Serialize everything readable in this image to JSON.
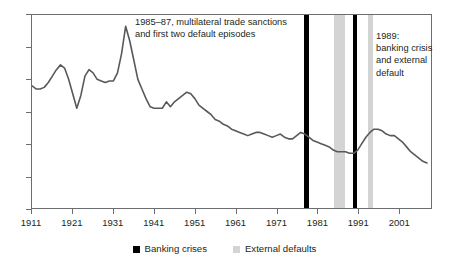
{
  "chart_data": {
    "type": "line",
    "title": "",
    "xlabel": "",
    "ylabel": "",
    "xlim": [
      1911,
      2009
    ],
    "ylim": [
      0,
      120
    ],
    "grid": false,
    "legend_position": "bottom-center",
    "y_ticks": [
      0,
      20,
      40,
      60,
      80,
      100,
      120
    ],
    "y_tick_labels": [
      "0",
      "20",
      "40",
      "60",
      "80",
      "100",
      "120"
    ],
    "x_ticks": [
      1911,
      1921,
      1931,
      1941,
      1951,
      1961,
      1971,
      1981,
      1991,
      2001
    ],
    "x_tick_labels": [
      "1911",
      "1921",
      "1931",
      "1941",
      "1951",
      "1961",
      "1971",
      "1981",
      "1991",
      "2001"
    ],
    "line_color": "#58595b",
    "series": [
      {
        "name": "index",
        "x": [
          1911,
          1912,
          1913,
          1914,
          1915,
          1916,
          1917,
          1918,
          1919,
          1920,
          1921,
          1922,
          1923,
          1924,
          1925,
          1926,
          1927,
          1928,
          1929,
          1930,
          1931,
          1932,
          1933,
          1934,
          1935,
          1936,
          1937,
          1938,
          1939,
          1940,
          1941,
          1942,
          1943,
          1944,
          1945,
          1946,
          1947,
          1948,
          1949,
          1950,
          1951,
          1952,
          1953,
          1954,
          1955,
          1956,
          1957,
          1958,
          1959,
          1960,
          1961,
          1962,
          1963,
          1964,
          1965,
          1966,
          1967,
          1968,
          1969,
          1970,
          1971,
          1972,
          1973,
          1974,
          1975,
          1976,
          1977,
          1978,
          1979,
          1980,
          1981,
          1982,
          1983,
          1984,
          1985,
          1986,
          1987,
          1988,
          1989,
          1990,
          1991,
          1992,
          1993,
          1994,
          1995,
          1996,
          1997,
          1998,
          1999,
          2000,
          2001,
          2002,
          2003,
          2004,
          2005,
          2006,
          2007,
          2008
        ],
        "values": [
          76,
          74,
          74,
          75,
          78,
          82,
          86,
          89,
          87,
          80,
          71,
          62,
          70,
          82,
          86,
          84,
          80,
          79,
          78,
          79,
          79,
          84,
          96,
          113,
          104,
          92,
          80,
          74,
          68,
          63,
          62,
          62,
          62,
          66,
          63,
          66,
          68,
          70,
          72,
          71,
          68,
          64,
          62,
          60,
          58,
          55,
          54,
          52,
          51,
          49,
          48,
          47,
          46,
          45,
          46,
          47,
          47,
          46,
          45,
          44,
          45,
          46,
          44,
          43,
          43,
          45,
          47,
          46,
          44,
          42,
          41,
          40,
          39,
          38,
          36,
          35,
          35,
          35,
          34,
          34,
          36,
          40,
          44,
          47,
          49,
          49,
          48,
          46,
          45,
          45,
          43,
          41,
          38,
          35,
          33,
          31,
          29,
          28
        ]
      }
    ],
    "bands": [
      {
        "type": "banking-crisis",
        "label": "Banking crises",
        "start": 1977.5,
        "end": 1978.6,
        "color": "#000000"
      },
      {
        "type": "external-default",
        "label": "External defaults",
        "start": 1984.8,
        "end": 1987.6,
        "color": "#d4d4d4"
      },
      {
        "type": "banking-crisis",
        "label": "Banking crises",
        "start": 1989.4,
        "end": 1990.4,
        "color": "#000000"
      },
      {
        "type": "external-default",
        "label": "External defaults",
        "start": 1993.0,
        "end": 1994.3,
        "color": "#d4d4d4"
      }
    ],
    "annotations": [
      {
        "id": "left",
        "text": "1985–87, multilateral trade sanctions\nand first two default episodes"
      },
      {
        "id": "right",
        "text": "1989:\nbanking crisis\nand external\ndefault"
      }
    ],
    "legend": [
      {
        "label": "Banking crises",
        "color": "#000000"
      },
      {
        "label": "External defaults",
        "color": "#d4d4d4"
      }
    ]
  }
}
